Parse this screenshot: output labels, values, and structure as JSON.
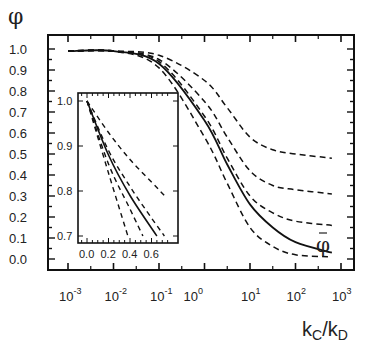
{
  "chart_data": [
    {
      "type": "line",
      "title": "",
      "ylabel": "φ",
      "xlabel": "kC/kD",
      "xscale": "log",
      "xlim": [
        0.001,
        1000
      ],
      "ylim": [
        0.0,
        1.0
      ],
      "xticks": [
        "10^-3",
        "10^-2",
        "10^-1",
        "10^0",
        "10^1",
        "10^2",
        "10^3"
      ],
      "yticks": [
        "0.0",
        "0.1",
        "0.2",
        "0.3",
        "0.4",
        "0.5",
        "0.6",
        "0.7",
        "0.8",
        "0.9",
        "1.0"
      ],
      "grid": false,
      "legend": null,
      "annotations": [
        {
          "text": "φ̄",
          "near_series": "phi_bar",
          "x": 600,
          "y": 0.1
        }
      ],
      "x": [
        0.001,
        0.01,
        0.1,
        1,
        3.16,
        10,
        31.6,
        100,
        630
      ],
      "series": [
        {
          "name": "dashed-1",
          "style": "dashed",
          "values": [
            0.99,
            0.99,
            0.97,
            0.85,
            0.72,
            0.58,
            0.52,
            0.5,
            0.48
          ]
        },
        {
          "name": "dashed-2",
          "style": "dashed",
          "values": [
            0.99,
            0.99,
            0.95,
            0.75,
            0.58,
            0.42,
            0.35,
            0.33,
            0.31
          ]
        },
        {
          "name": "dashed-3",
          "style": "dashed",
          "values": [
            0.99,
            0.99,
            0.94,
            0.68,
            0.48,
            0.3,
            0.22,
            0.18,
            0.16
          ]
        },
        {
          "name": "phi_bar",
          "style": "solid",
          "values": [
            0.99,
            0.99,
            0.93,
            0.66,
            0.45,
            0.26,
            0.15,
            0.08,
            0.03
          ]
        },
        {
          "name": "dashed-4",
          "style": "dashed",
          "values": [
            0.99,
            0.99,
            0.91,
            0.58,
            0.36,
            0.15,
            0.06,
            0.02,
            0.01
          ]
        }
      ]
    },
    {
      "type": "line",
      "title": "inset",
      "xlim": [
        -0.05,
        0.78
      ],
      "ylim": [
        0.69,
        1.02
      ],
      "xticks": [
        "0.0",
        "0.2",
        "0.4",
        "0.6"
      ],
      "yticks": [
        "0.7",
        "0.8",
        "0.9",
        "1.0"
      ],
      "grid": false,
      "series": [
        {
          "name": "dashed-1",
          "style": "dashed",
          "x": [
            0.0,
            0.2,
            0.4,
            0.6,
            0.72
          ],
          "values": [
            1.0,
            0.93,
            0.87,
            0.82,
            0.79
          ]
        },
        {
          "name": "dashed-2",
          "style": "dashed",
          "x": [
            0.0,
            0.2,
            0.4,
            0.6,
            0.72
          ],
          "values": [
            1.0,
            0.89,
            0.81,
            0.74,
            0.7
          ]
        },
        {
          "name": "phi_bar",
          "style": "solid",
          "x": [
            0.0,
            0.2,
            0.4,
            0.65
          ],
          "values": [
            1.0,
            0.88,
            0.79,
            0.7
          ]
        },
        {
          "name": "dashed-3",
          "style": "dashed",
          "x": [
            0.0,
            0.2,
            0.4,
            0.52
          ],
          "values": [
            1.0,
            0.86,
            0.76,
            0.7
          ]
        },
        {
          "name": "dashed-4",
          "style": "dashed",
          "x": [
            0.0,
            0.2,
            0.38
          ],
          "values": [
            1.0,
            0.84,
            0.7
          ]
        }
      ]
    }
  ],
  "labels": {
    "y_axis_title": "φ",
    "x_axis_title_main": "k",
    "x_axis_sub1": "C",
    "x_axis_sep": "/k",
    "x_axis_sub2": "D",
    "curve_label": "φ",
    "y_ticks": [
      "1.0",
      "0.9",
      "0.8",
      "0.7",
      "0.6",
      "0.5",
      "0.4",
      "0.3",
      "0.2",
      "0.1",
      "0.0"
    ],
    "x_tick_base": "10",
    "x_tick_exps": [
      "-3",
      "-2",
      "-1",
      "0",
      "1",
      "2",
      "3"
    ],
    "inset_y_ticks": [
      "1.0",
      "0.9",
      "0.8",
      "0.7"
    ],
    "inset_x_ticks": [
      "0.0",
      "0.2",
      "0.4",
      "0.6"
    ]
  }
}
